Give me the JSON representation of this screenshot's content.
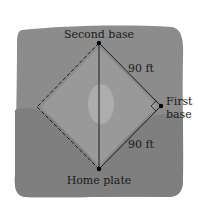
{
  "diagram": {
    "type": "baseball-diamond",
    "colors": {
      "field": "#8c8c8c",
      "field_dark": "#7f7f7f",
      "infield": "#999999",
      "mound": "#b3b3b3",
      "line": "#1a1a1a",
      "text": "#1a1a1a",
      "background": "#ffffff"
    },
    "points": {
      "second_base": {
        "x": 99,
        "y": 43
      },
      "first_base": {
        "x": 161,
        "y": 106
      },
      "home_plate": {
        "x": 99,
        "y": 169
      },
      "third_base": {
        "x": 37,
        "y": 107
      }
    },
    "labels": {
      "second_base": "Second base",
      "first_base_line1": "First",
      "first_base_line2": "base",
      "home_plate": "Home plate",
      "side_upper": "90 ft",
      "side_lower": "90 ft"
    },
    "edges": [
      {
        "from": "second_base",
        "to": "first_base",
        "style": "solid",
        "label": "90 ft"
      },
      {
        "from": "first_base",
        "to": "home_plate",
        "style": "solid",
        "label": "90 ft"
      },
      {
        "from": "home_plate",
        "to": "second_base",
        "style": "solid"
      },
      {
        "from": "second_base",
        "to": "third_base",
        "style": "dashed"
      },
      {
        "from": "third_base",
        "to": "home_plate",
        "style": "dashed"
      }
    ],
    "right_angle_marker_at": "first_base"
  }
}
